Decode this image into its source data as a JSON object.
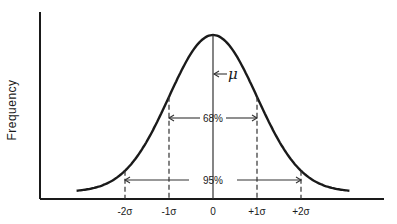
{
  "chart_data": {
    "type": "line",
    "title": "",
    "xlabel": "",
    "ylabel": "Frequency",
    "distribution": "normal",
    "mean": 0,
    "sd": 1,
    "x_range": [
      -3.2,
      3.2
    ],
    "x_ticks": [
      {
        "value": -2,
        "label": "-2σ"
      },
      {
        "value": -1,
        "label": "-1σ"
      },
      {
        "value": 0,
        "label": "0"
      },
      {
        "value": 1,
        "label": "+1σ"
      },
      {
        "value": 2,
        "label": "+2σ"
      }
    ],
    "annotations": [
      {
        "name": "mean-marker",
        "label": "μ",
        "x": 0
      },
      {
        "name": "one-sigma-interval",
        "label": "68%",
        "from": -1,
        "to": 1
      },
      {
        "name": "two-sigma-interval",
        "label": "95%",
        "from": -2,
        "to": 2
      }
    ],
    "grid": false,
    "legend": "none"
  }
}
